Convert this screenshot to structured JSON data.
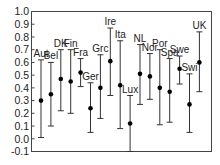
{
  "chart_data": {
    "type": "errorbar",
    "title": "",
    "xlabel": "",
    "ylabel": "",
    "ylim": [
      -0.1,
      1.0
    ],
    "yticks": [
      "1.0",
      "0.9",
      "0.8",
      "0.7",
      "0.6",
      "0.5",
      "0.4",
      "0.3",
      "0.2",
      "0.1",
      "0.0",
      "-0.1"
    ],
    "grid": false,
    "legend": null,
    "categories": [
      "Aut",
      "Bel",
      "DK",
      "Fin",
      "Fra",
      "Ger",
      "Grc",
      "Ire",
      "Ita",
      "Lux",
      "NL",
      "Nor",
      "Por",
      "Spa",
      "Swe",
      "Swi",
      "UK"
    ],
    "series": [
      {
        "name": "estimate",
        "values": [
          0.3,
          0.35,
          0.47,
          0.45,
          0.52,
          0.24,
          0.4,
          0.61,
          0.42,
          0.12,
          0.51,
          0.49,
          0.4,
          0.37,
          0.55,
          0.27,
          0.6
        ],
        "lower": [
          0.01,
          0.1,
          0.22,
          0.2,
          0.41,
          0.05,
          0.16,
          0.34,
          0.08,
          -0.1,
          0.27,
          0.31,
          0.11,
          0.13,
          0.43,
          0.05,
          0.37
        ],
        "upper": [
          0.62,
          0.6,
          0.7,
          0.7,
          0.63,
          0.44,
          0.66,
          0.87,
          0.77,
          0.34,
          0.74,
          0.67,
          0.7,
          0.63,
          0.65,
          0.51,
          0.84
        ]
      }
    ],
    "colors": {
      "line": "#333333",
      "point": "#000000",
      "axis": "#444444"
    }
  }
}
